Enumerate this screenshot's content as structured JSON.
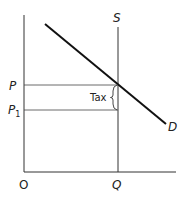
{
  "diagram": {
    "type": "supply-demand-tax",
    "labels": {
      "supply": "S",
      "demand": "D",
      "price": "P",
      "price_after_tax": "P",
      "price_after_tax_sub": "1",
      "tax": "Tax",
      "origin": "O",
      "quantity": "Q"
    },
    "colors": {
      "line": "#222222",
      "background": "#ffffff"
    }
  }
}
